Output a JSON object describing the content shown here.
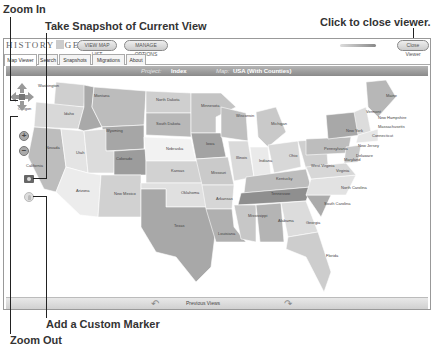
{
  "callouts": {
    "zoom_in": "Zoom In",
    "snapshot": "Take Snapshot of Current View",
    "close_viewer": "Click to close viewer.",
    "custom_marker": "Add a Custom Marker",
    "zoom_out": "Zoom Out"
  },
  "app": {
    "logo": {
      "left": "HISTORY",
      "right": "GEO"
    },
    "buttons": {
      "view_map_list": "VIEW MAP LIST",
      "manage_options": "MANAGE OPTIONS",
      "close_viewer": "Close Viewer"
    }
  },
  "tabs": [
    {
      "label": "Map Viewer",
      "active": true
    },
    {
      "label": "Search",
      "active": false
    },
    {
      "label": "Snapshots",
      "active": false
    },
    {
      "label": "Migrations",
      "active": false
    },
    {
      "label": "About",
      "active": false
    }
  ],
  "titlebar": {
    "project_label": "Project:",
    "project_value": "Index",
    "map_label": "Map:",
    "map_value": "USA (With Counties)"
  },
  "map": {
    "states": [
      {
        "name": "Washington",
        "x": 32,
        "y": 10
      },
      {
        "name": "Oregon",
        "x": 12,
        "y": 33
      },
      {
        "name": "Idaho",
        "x": 58,
        "y": 38
      },
      {
        "name": "Montana",
        "x": 88,
        "y": 20
      },
      {
        "name": "Wyoming",
        "x": 100,
        "y": 55
      },
      {
        "name": "Nevada",
        "x": 40,
        "y": 72
      },
      {
        "name": "Utah",
        "x": 70,
        "y": 77
      },
      {
        "name": "California",
        "x": 20,
        "y": 90
      },
      {
        "name": "Colorado",
        "x": 110,
        "y": 83
      },
      {
        "name": "Arizona",
        "x": 70,
        "y": 115
      },
      {
        "name": "New Mexico",
        "x": 108,
        "y": 118
      },
      {
        "name": "North Dakota",
        "x": 150,
        "y": 24
      },
      {
        "name": "South Dakota",
        "x": 150,
        "y": 48
      },
      {
        "name": "Nebraska",
        "x": 160,
        "y": 73
      },
      {
        "name": "Kansas",
        "x": 165,
        "y": 95
      },
      {
        "name": "Oklahoma",
        "x": 175,
        "y": 117
      },
      {
        "name": "Texas",
        "x": 168,
        "y": 150
      },
      {
        "name": "Minnesota",
        "x": 195,
        "y": 30
      },
      {
        "name": "Iowa",
        "x": 200,
        "y": 68
      },
      {
        "name": "Missouri",
        "x": 205,
        "y": 97
      },
      {
        "name": "Arkansas",
        "x": 210,
        "y": 123
      },
      {
        "name": "Louisiana",
        "x": 212,
        "y": 158
      },
      {
        "name": "Wisconsin",
        "x": 230,
        "y": 40
      },
      {
        "name": "Illinois",
        "x": 230,
        "y": 82
      },
      {
        "name": "Michigan",
        "x": 265,
        "y": 48
      },
      {
        "name": "Indiana",
        "x": 253,
        "y": 85
      },
      {
        "name": "Ohio",
        "x": 283,
        "y": 80
      },
      {
        "name": "Kentucky",
        "x": 270,
        "y": 103
      },
      {
        "name": "Tennessee",
        "x": 265,
        "y": 118
      },
      {
        "name": "Mississippi",
        "x": 242,
        "y": 140
      },
      {
        "name": "Alabama",
        "x": 272,
        "y": 145
      },
      {
        "name": "Georgia",
        "x": 300,
        "y": 147
      },
      {
        "name": "Florida",
        "x": 320,
        "y": 180
      },
      {
        "name": "South Carolina",
        "x": 318,
        "y": 128
      },
      {
        "name": "North Carolina",
        "x": 335,
        "y": 112
      },
      {
        "name": "Virginia",
        "x": 330,
        "y": 95
      },
      {
        "name": "West Virginia",
        "x": 305,
        "y": 90
      },
      {
        "name": "Pennsylvania",
        "x": 318,
        "y": 73
      },
      {
        "name": "New York",
        "x": 340,
        "y": 55
      },
      {
        "name": "Maine",
        "x": 380,
        "y": 20
      },
      {
        "name": "Vermont",
        "x": 360,
        "y": 36
      },
      {
        "name": "New Hampshire",
        "x": 372,
        "y": 42
      },
      {
        "name": "Massachusetts",
        "x": 372,
        "y": 51
      },
      {
        "name": "Connecticut",
        "x": 366,
        "y": 60
      },
      {
        "name": "New Jersey",
        "x": 352,
        "y": 70
      },
      {
        "name": "Delaware",
        "x": 350,
        "y": 80
      },
      {
        "name": "Maryland",
        "x": 338,
        "y": 84
      }
    ]
  },
  "bottombar": {
    "previous_views": "Previous Views"
  },
  "controls": {
    "pan": "pan-arrows",
    "zoom_in": "+",
    "zoom_out": "−",
    "snapshot": "camera",
    "marker": "marker"
  }
}
